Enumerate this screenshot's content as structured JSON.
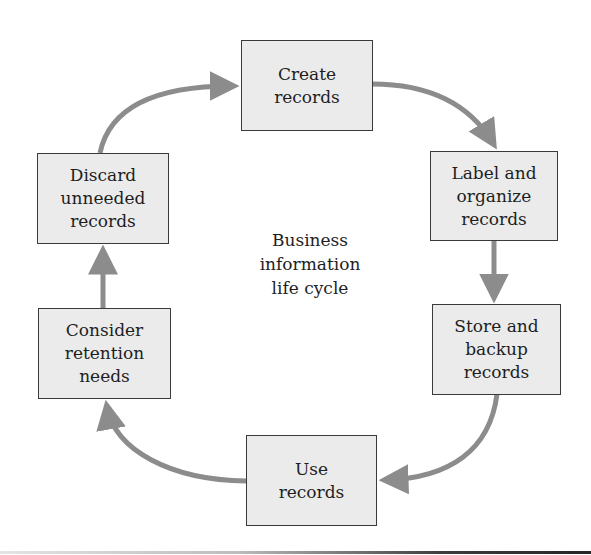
{
  "diagram": {
    "type": "cycle",
    "title": "Business information life cycle",
    "center_label": "Business\ninformation\nlife cycle",
    "colors": {
      "box_fill": "#ebebeb",
      "box_border": "#3a3a3a",
      "arrow": "#8c8c8c",
      "text": "#1e1e1e"
    },
    "steps": [
      {
        "id": "create",
        "label": "Create\nrecords"
      },
      {
        "id": "label",
        "label": "Label and\norganize\nrecords"
      },
      {
        "id": "store",
        "label": "Store and\nbackup\nrecords"
      },
      {
        "id": "use",
        "label": "Use\nrecords"
      },
      {
        "id": "consider",
        "label": "Consider\nretention\nneeds"
      },
      {
        "id": "discard",
        "label": "Discard\nunneeded\nrecords"
      }
    ],
    "edges": [
      {
        "from": "create",
        "to": "label"
      },
      {
        "from": "label",
        "to": "store"
      },
      {
        "from": "store",
        "to": "use"
      },
      {
        "from": "use",
        "to": "consider"
      },
      {
        "from": "consider",
        "to": "discard"
      },
      {
        "from": "discard",
        "to": "create"
      }
    ]
  }
}
